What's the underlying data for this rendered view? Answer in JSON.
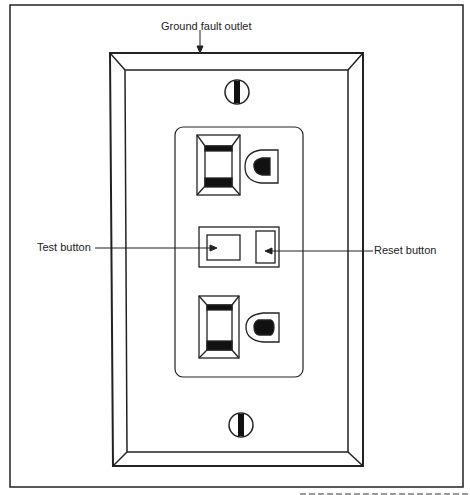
{
  "diagram": {
    "title_label": "Ground fault outlet",
    "callouts": {
      "test": "Test button",
      "reset": "Reset button"
    },
    "caption_fragment": "...this load is removing the test button"
  }
}
